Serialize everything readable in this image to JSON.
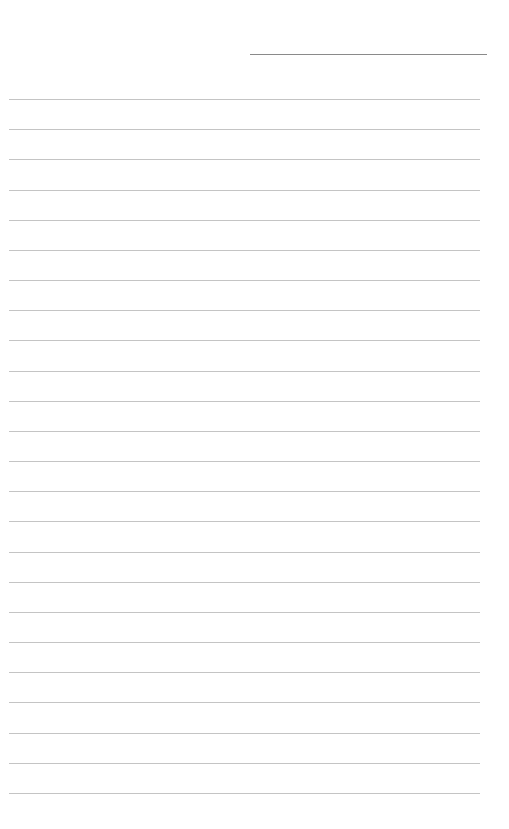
{
  "document": {
    "type": "blank lined paper",
    "header_line": {
      "present": true,
      "text": ""
    },
    "line_count": 24,
    "lines": [
      "",
      "",
      "",
      "",
      "",
      "",
      "",
      "",
      "",
      "",
      "",
      "",
      "",
      "",
      "",
      "",
      "",
      "",
      "",
      "",
      "",
      "",
      "",
      ""
    ],
    "colors": {
      "background": "#ffffff",
      "rule": "#c4c4c4",
      "header_rule": "#8a8a8a"
    }
  }
}
